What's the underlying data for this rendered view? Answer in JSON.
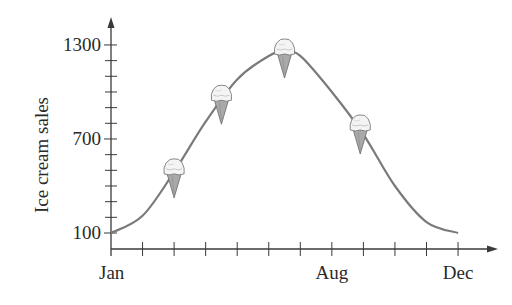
{
  "chart_data": {
    "type": "line",
    "title": "",
    "xlabel": "",
    "ylabel": "Ice cream sales",
    "x_tick_labels": [
      {
        "label": "Jan",
        "month_index": 0
      },
      {
        "label": "Aug",
        "month_index": 7
      },
      {
        "label": "Dec",
        "month_index": 11
      }
    ],
    "y_tick_labels": [
      100,
      700,
      1300
    ],
    "y_minor_step": 100,
    "ylim": [
      100,
      1300
    ],
    "xlim": [
      0,
      11
    ],
    "x_month_ticks": 12,
    "series": [
      {
        "name": "Ice cream sales",
        "color": "#7a7a7a",
        "x": [
          0,
          1,
          2,
          3,
          4,
          5,
          5.5,
          6,
          7,
          8,
          9,
          10,
          11
        ],
        "values": [
          100,
          210,
          490,
          810,
          1080,
          1230,
          1255,
          1230,
          1000,
          730,
          400,
          170,
          100
        ]
      }
    ],
    "markers": [
      {
        "icon": "ice-cream-cone-icon",
        "month_index": 2.0,
        "value": 490
      },
      {
        "icon": "ice-cream-cone-icon",
        "month_index": 3.5,
        "value": 960
      },
      {
        "icon": "ice-cream-cone-icon",
        "month_index": 5.5,
        "value": 1255
      },
      {
        "icon": "ice-cream-cone-icon",
        "month_index": 7.9,
        "value": 770
      }
    ],
    "grid": false,
    "legend": "none"
  },
  "colors": {
    "axis": "#3a3a3a",
    "curve": "#7a7a7a",
    "cone": "#a9a9a9",
    "scoop": "#f4f4f4"
  }
}
